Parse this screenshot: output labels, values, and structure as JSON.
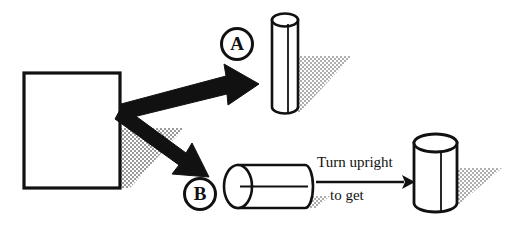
{
  "diagram": {
    "background_color": "#ffffff",
    "stroke_color": "#111111",
    "shadow_color": "#b8b8b8",
    "source_shape": {
      "name": "rectangle",
      "fill": "#ffffff",
      "stroke": "#111111"
    },
    "branches": [
      {
        "key": "A",
        "label": "A",
        "result": "tall narrow vertical cylinder",
        "orientation": "upright"
      },
      {
        "key": "B",
        "label": "B",
        "result": "short wide cylinder lying on its side",
        "orientation": "horizontal"
      }
    ],
    "caption": {
      "line1": "Turn upright",
      "line2": "to get"
    },
    "final_shape": {
      "name": "wide upright cylinder",
      "orientation": "upright"
    },
    "icons": {
      "arrow_branch_a": "arrow-up-right-icon",
      "arrow_branch_b": "arrow-down-right-icon",
      "arrow_transform": "arrow-right-icon"
    }
  }
}
